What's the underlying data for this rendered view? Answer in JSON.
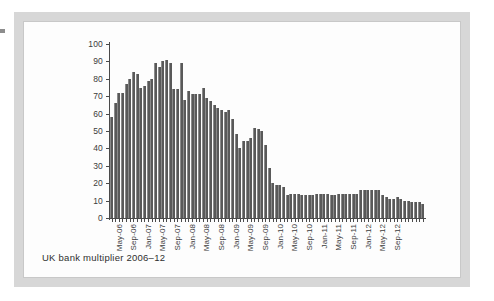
{
  "figure": {
    "caption": "UK bank multiplier 2006–12",
    "frame_color": "#d7d7d7",
    "panel_color": "#fdfdfd",
    "bar_color": "#595959",
    "axis_color": "#4a4a4a"
  },
  "chart_data": {
    "type": "bar",
    "title": "UK bank multiplier 2006–12",
    "xlabel": "",
    "ylabel": "",
    "ylim": [
      0,
      100
    ],
    "yticks": [
      0,
      10,
      20,
      30,
      40,
      50,
      60,
      70,
      80,
      90,
      100
    ],
    "grid": false,
    "legend": null,
    "tick_labels": [
      "May-06",
      "Sep-06",
      "Jan-07",
      "May-07",
      "Sep-07",
      "Jan-08",
      "May-08",
      "Sep-08",
      "Jan-09",
      "May-09",
      "Sep-09",
      "Jan-10",
      "May-10",
      "Sep-10",
      "Jan-11",
      "May-11",
      "Sep-11",
      "Jan-12",
      "May-12",
      "Sep-12"
    ],
    "tick_label_interval_months": 4,
    "categories": [
      "May-06",
      "Jun-06",
      "Jul-06",
      "Aug-06",
      "Sep-06",
      "Oct-06",
      "Nov-06",
      "Dec-06",
      "Jan-07",
      "Feb-07",
      "Mar-07",
      "Apr-07",
      "May-07",
      "Jun-07",
      "Jul-07",
      "Aug-07",
      "Sep-07",
      "Oct-07",
      "Nov-07",
      "Dec-07",
      "Jan-08",
      "Feb-08",
      "Mar-08",
      "Apr-08",
      "May-08",
      "Jun-08",
      "Jul-08",
      "Aug-08",
      "Sep-08",
      "Oct-08",
      "Nov-08",
      "Dec-08",
      "Jan-09",
      "Feb-09",
      "Mar-09",
      "Apr-09",
      "May-09",
      "Jun-09",
      "Jul-09",
      "Aug-09",
      "Sep-09",
      "Oct-09",
      "Nov-09",
      "Dec-09",
      "Jan-10",
      "Feb-10",
      "Mar-10",
      "Apr-10",
      "May-10",
      "Jun-10",
      "Jul-10",
      "Aug-10",
      "Sep-10",
      "Oct-10",
      "Nov-10",
      "Dec-10",
      "Jan-11",
      "Feb-11",
      "Mar-11",
      "Apr-11",
      "May-11",
      "Jun-11",
      "Jul-11",
      "Aug-11",
      "Sep-11",
      "Oct-11",
      "Nov-11",
      "Dec-11",
      "Jan-12",
      "Feb-12",
      "Mar-12",
      "Apr-12",
      "May-12",
      "Jun-12",
      "Jul-12",
      "Aug-12",
      "Sep-12",
      "Oct-12"
    ],
    "values": [
      58,
      66,
      72,
      72,
      77,
      80,
      84,
      83,
      75,
      76,
      79,
      80,
      89,
      87,
      90,
      91,
      89,
      74,
      74,
      89,
      68,
      73,
      71,
      71,
      71,
      75,
      69,
      67,
      65,
      63,
      62,
      61,
      62,
      57,
      48,
      40,
      44,
      44,
      46,
      52,
      51,
      50,
      42,
      29,
      20,
      19,
      19,
      18,
      13,
      14,
      14,
      14,
      13,
      13,
      13,
      13,
      14,
      14,
      14,
      14,
      13,
      13,
      14,
      14,
      14,
      14,
      14,
      14,
      16,
      16,
      16,
      16,
      16,
      16,
      13,
      12,
      11,
      11
    ],
    "tail_values_note": [
      12,
      11,
      10,
      10,
      9,
      9,
      9,
      8
    ]
  }
}
